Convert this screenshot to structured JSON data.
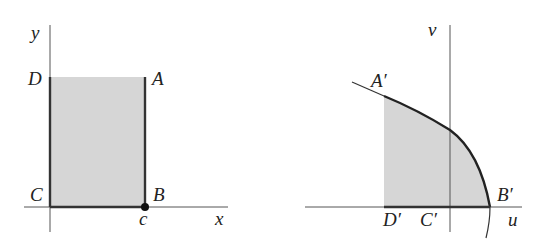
{
  "left_panel": {
    "axes": {
      "x_label": "x",
      "y_label": "y"
    },
    "vertices": {
      "A": "A",
      "B": "B",
      "C": "C",
      "D": "D"
    },
    "tick_label": "c",
    "region_fill": "#d6d6d6"
  },
  "right_panel": {
    "axes": {
      "u_label": "u",
      "v_label": "v"
    },
    "vertices": {
      "A": "A′",
      "B": "B′",
      "C": "C′",
      "D": "D′"
    },
    "region_fill": "#d6d6d6"
  },
  "colors": {
    "line": "#333333",
    "axis": "#555555",
    "fill": "#d6d6d6"
  }
}
